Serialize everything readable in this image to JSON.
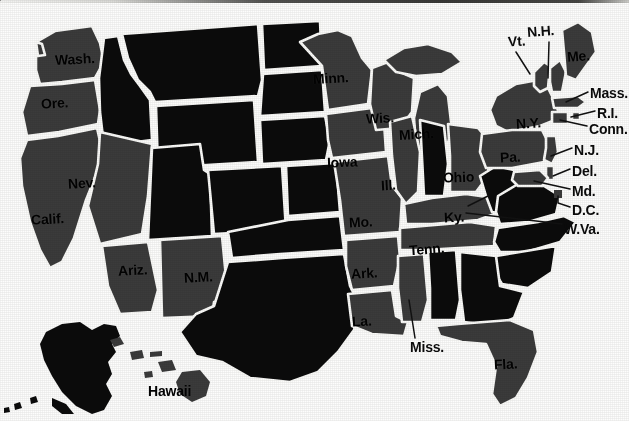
{
  "figure": {
    "kind": "map",
    "background_color": "#fdfdfc",
    "labeled_state_color": "#3b3b3b",
    "unlabeled_state_color": "#0b0b0b",
    "border_color": "#fbfbf9",
    "label_color": "#0d0d0d",
    "has_top_rule": true
  },
  "labels": {
    "on_map": [
      {
        "name": "washington",
        "text": "Wash.",
        "x": 55,
        "y": 52,
        "size": 14,
        "rotate": -3
      },
      {
        "name": "oregon",
        "text": "Ore.",
        "x": 41,
        "y": 96,
        "size": 14,
        "rotate": -3
      },
      {
        "name": "nevada",
        "text": "Nev.",
        "x": 68,
        "y": 176,
        "size": 14,
        "rotate": -3
      },
      {
        "name": "california",
        "text": "Calif.",
        "x": 31,
        "y": 212,
        "size": 14,
        "rotate": -3
      },
      {
        "name": "arizona",
        "text": "Ariz.",
        "x": 118,
        "y": 263,
        "size": 14,
        "rotate": -3
      },
      {
        "name": "new-mexico",
        "text": "N.M.",
        "x": 184,
        "y": 270,
        "size": 14,
        "rotate": -3
      },
      {
        "name": "minnesota",
        "text": "Minn.",
        "x": 313,
        "y": 71,
        "size": 14,
        "rotate": -3
      },
      {
        "name": "wisconsin",
        "text": "Wis.",
        "x": 366,
        "y": 111,
        "size": 14,
        "rotate": -3
      },
      {
        "name": "michigan",
        "text": "Mich.",
        "x": 399,
        "y": 127,
        "size": 14,
        "rotate": -3
      },
      {
        "name": "iowa",
        "text": "Iowa",
        "x": 327,
        "y": 155,
        "size": 14,
        "rotate": -2
      },
      {
        "name": "illinois",
        "text": "Ill.",
        "x": 381,
        "y": 178,
        "size": 14,
        "rotate": -3
      },
      {
        "name": "ohio",
        "text": "Ohio",
        "x": 443,
        "y": 170,
        "size": 14,
        "rotate": -2
      },
      {
        "name": "missouri",
        "text": "Mo.",
        "x": 349,
        "y": 215,
        "size": 14,
        "rotate": -3
      },
      {
        "name": "kentucky",
        "text": "Ky.",
        "x": 444,
        "y": 210,
        "size": 14,
        "rotate": -3
      },
      {
        "name": "tennessee",
        "text": "Tenn.",
        "x": 409,
        "y": 242,
        "size": 14,
        "rotate": -4
      },
      {
        "name": "arkansas",
        "text": "Ark.",
        "x": 351,
        "y": 266,
        "size": 14,
        "rotate": -3
      },
      {
        "name": "louisiana",
        "text": "La.",
        "x": 352,
        "y": 314,
        "size": 14,
        "rotate": -3
      },
      {
        "name": "florida",
        "text": "Fla.",
        "x": 494,
        "y": 357,
        "size": 14,
        "rotate": -3
      },
      {
        "name": "new-york",
        "text": "N.Y.",
        "x": 516,
        "y": 116,
        "size": 14,
        "rotate": -3
      },
      {
        "name": "pennsylvania",
        "text": "Pa.",
        "x": 500,
        "y": 150,
        "size": 14,
        "rotate": -3
      },
      {
        "name": "maine",
        "text": "Me.",
        "x": 567,
        "y": 49,
        "size": 14,
        "rotate": -4
      },
      {
        "name": "hawaii",
        "text": "Hawaii",
        "x": 148,
        "y": 384,
        "size": 14,
        "rotate": 0
      }
    ],
    "callouts": [
      {
        "name": "vermont",
        "text": "Vt.",
        "x": 508,
        "y": 34,
        "size": 14,
        "rotate": -4,
        "leader": "516,52 530,74"
      },
      {
        "name": "new-hampshire",
        "text": "N.H.",
        "x": 527,
        "y": 24,
        "size": 14,
        "rotate": -4,
        "leader": "549,42 548,78"
      },
      {
        "name": "massachusetts",
        "text": "Mass.",
        "x": 590,
        "y": 86,
        "size": 14,
        "rotate": 0,
        "leader": "588,92 566,102"
      },
      {
        "name": "rhode-island",
        "text": "R.I.",
        "x": 597,
        "y": 106,
        "size": 14,
        "rotate": 0,
        "leader": "595,111 571,117"
      },
      {
        "name": "connecticut",
        "text": "Conn.",
        "x": 589,
        "y": 122,
        "size": 14,
        "rotate": 0,
        "leader": "587,126 560,120"
      },
      {
        "name": "new-jersey",
        "text": "N.J.",
        "x": 574,
        "y": 143,
        "size": 14,
        "rotate": 0,
        "leader": "572,148 551,156"
      },
      {
        "name": "delaware",
        "text": "Del.",
        "x": 572,
        "y": 164,
        "size": 14,
        "rotate": 0,
        "leader": "570,169 553,176"
      },
      {
        "name": "maryland",
        "text": "Md.",
        "x": 572,
        "y": 184,
        "size": 14,
        "rotate": 0,
        "leader": "570,189 534,181"
      },
      {
        "name": "district-of-columbia",
        "text": "D.C.",
        "x": 572,
        "y": 203,
        "size": 14,
        "rotate": 0,
        "leader": "570,207 558,203 558,196"
      },
      {
        "name": "west-virginia",
        "text": "W.Va.",
        "x": 564,
        "y": 222,
        "size": 14,
        "rotate": 0,
        "leader": "562,224 466,213"
      },
      {
        "name": "mississippi",
        "text": "Miss.",
        "x": 410,
        "y": 340,
        "size": 14,
        "rotate": 0,
        "leader": "415,338 409,300"
      }
    ]
  },
  "state_regions": {
    "labeled_gray": [
      "Wash.",
      "Ore.",
      "Nev.",
      "Calif.",
      "Ariz.",
      "N.M.",
      "Minn.",
      "Wis.",
      "Mich.",
      "Iowa",
      "Ill.",
      "Ohio",
      "Mo.",
      "Ky.",
      "Tenn.",
      "Ark.",
      "La.",
      "Fla.",
      "N.Y.",
      "Pa.",
      "Me.",
      "Hawaii",
      "Vt.",
      "N.H.",
      "Mass.",
      "R.I.",
      "Conn.",
      "N.J.",
      "Del.",
      "Md.",
      "D.C.",
      "W.Va.",
      "Miss."
    ],
    "unlabeled_black": [
      "Idaho",
      "Montana",
      "Wyoming",
      "Utah",
      "Colorado",
      "North Dakota",
      "South Dakota",
      "Nebraska",
      "Kansas",
      "Oklahoma",
      "Texas",
      "Indiana",
      "Alabama",
      "Georgia",
      "South Carolina",
      "North Carolina",
      "Virginia",
      "Alaska"
    ]
  }
}
